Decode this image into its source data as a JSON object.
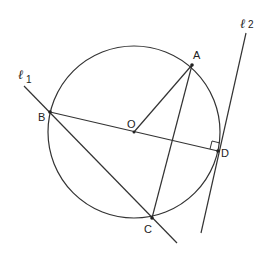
{
  "diagram": {
    "circle": {
      "center": "O",
      "cx": 134,
      "cy": 132,
      "r": 86
    },
    "points": {
      "A": {
        "label": "A",
        "x": 192,
        "y": 65
      },
      "B": {
        "label": "B",
        "x": 50,
        "y": 112
      },
      "C": {
        "label": "C",
        "x": 152,
        "y": 218
      },
      "D": {
        "label": "D",
        "x": 218,
        "y": 151
      },
      "O": {
        "label": "O",
        "x": 134,
        "y": 132
      }
    },
    "lines": {
      "l1": {
        "label": "ℓ",
        "subscript": "1"
      },
      "l2": {
        "label": "ℓ",
        "subscript": "2"
      }
    },
    "segments": [
      "BD",
      "OA",
      "AC",
      "BC"
    ],
    "right_angle_at": "D",
    "stroke_color": "#333333"
  }
}
